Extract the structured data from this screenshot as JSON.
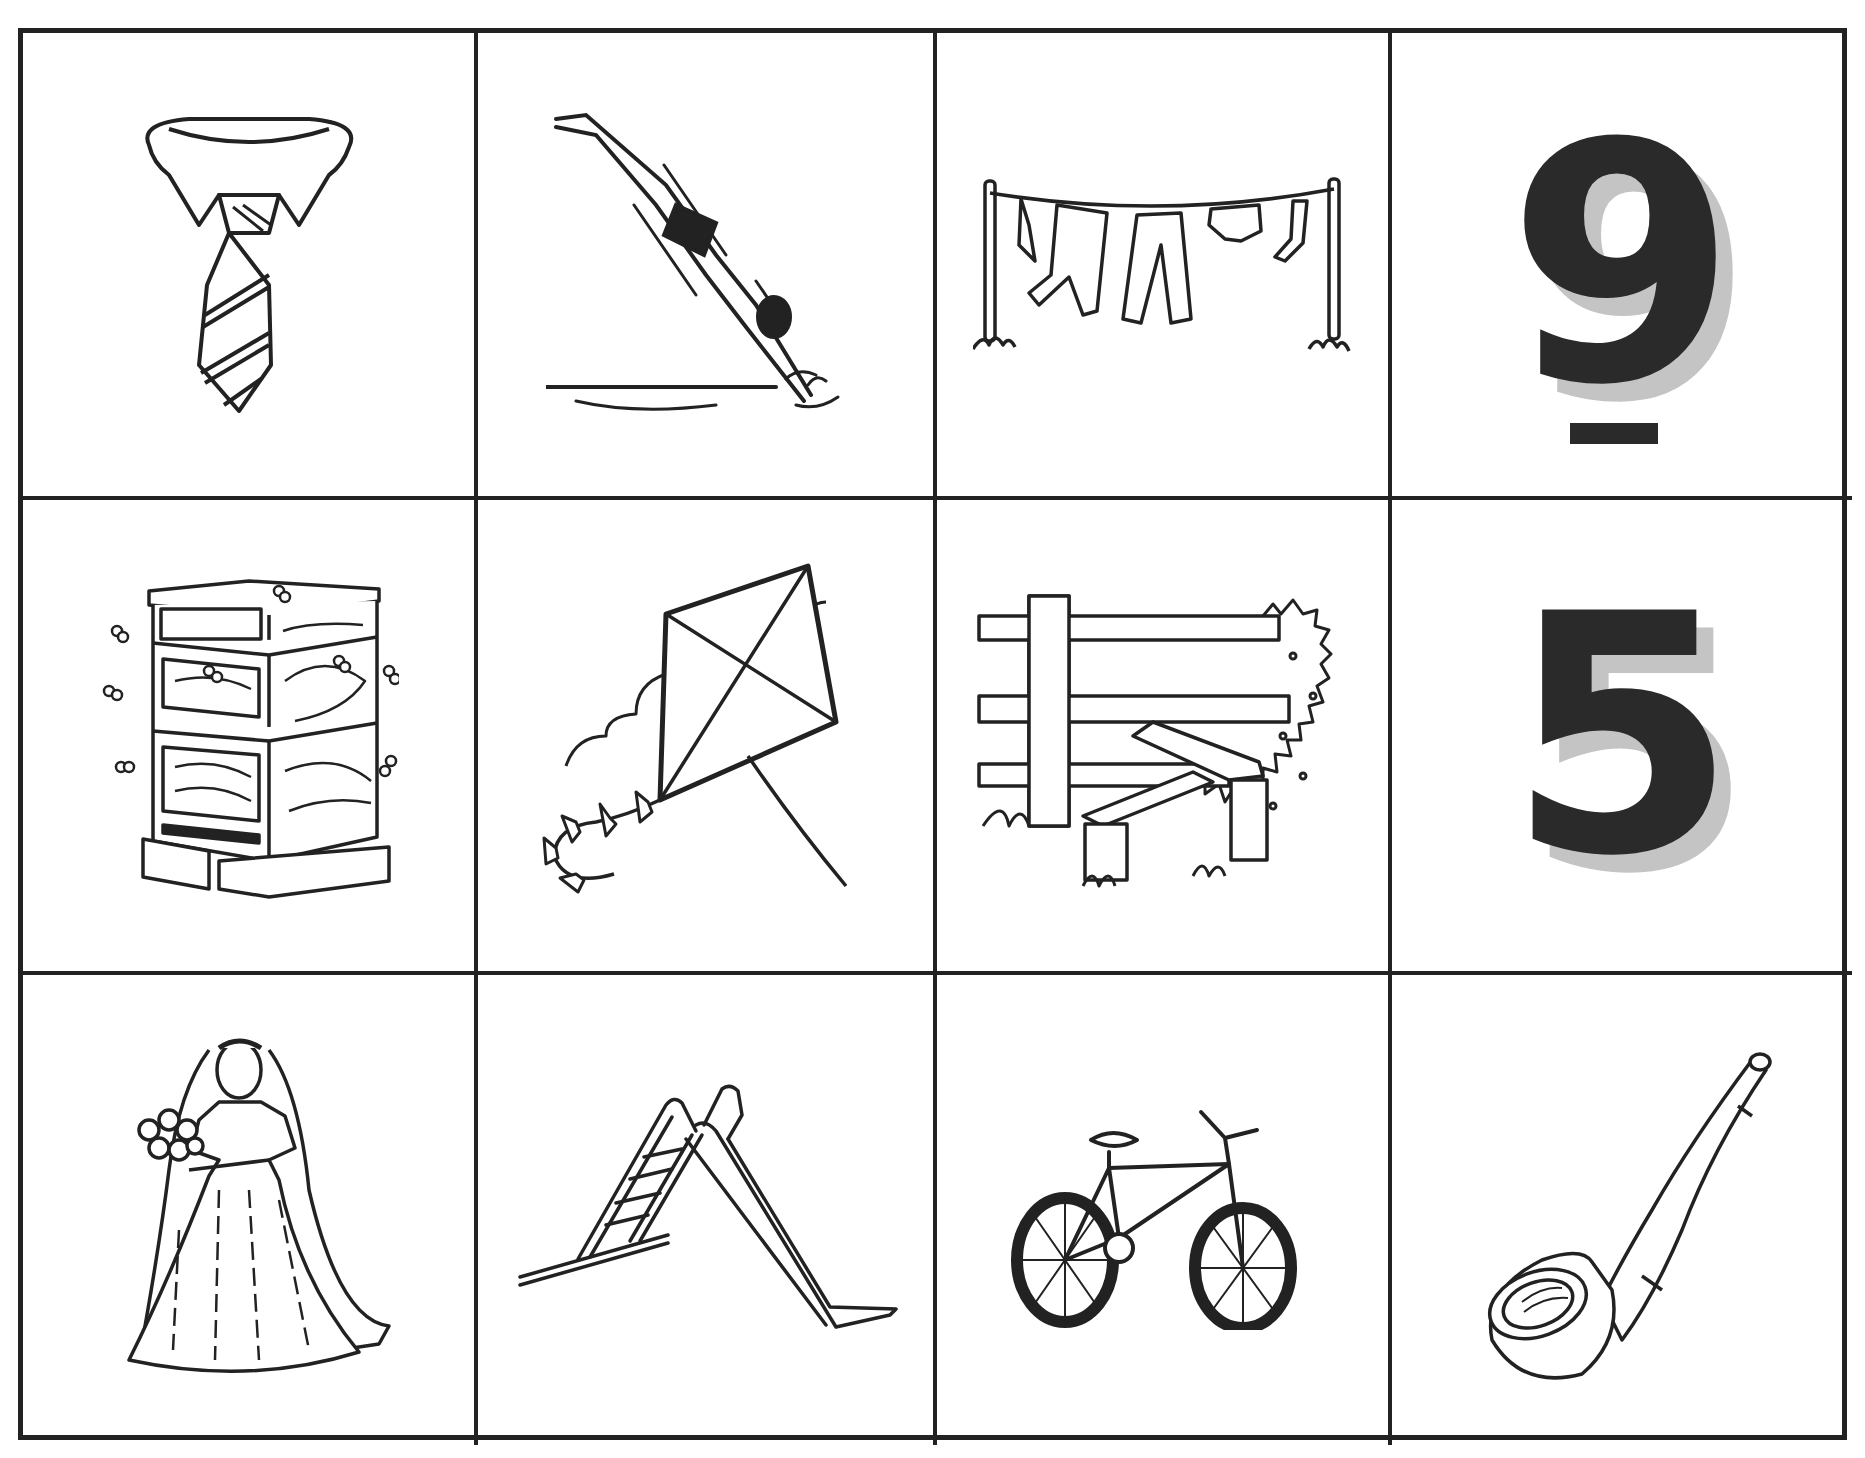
{
  "worksheet": {
    "colors": {
      "ink": "#2a2a2a",
      "numeral_shadow": "#c4c4c4",
      "grid_line": "#222222",
      "background": "#ffffff"
    },
    "rows": 3,
    "cols": 4,
    "cells": [
      {
        "row": 1,
        "col": 1,
        "type": "picture",
        "subject": "necktie with shirt collar",
        "icon": "necktie-icon"
      },
      {
        "row": 1,
        "col": 2,
        "type": "picture",
        "subject": "diver diving into water",
        "icon": "diver-icon"
      },
      {
        "row": 1,
        "col": 3,
        "type": "picture",
        "subject": "washing line with clothes",
        "icon": "clothesline-icon"
      },
      {
        "row": 1,
        "col": 4,
        "type": "numeral",
        "value": "9",
        "underlined": true
      },
      {
        "row": 2,
        "col": 1,
        "type": "picture",
        "subject": "beehive with bees",
        "icon": "beehive-icon"
      },
      {
        "row": 2,
        "col": 2,
        "type": "picture",
        "subject": "kite with tail and clouds",
        "icon": "kite-icon"
      },
      {
        "row": 2,
        "col": 3,
        "type": "picture",
        "subject": "wooden fence stile with bush",
        "icon": "stile-icon"
      },
      {
        "row": 2,
        "col": 4,
        "type": "numeral",
        "value": "5",
        "underlined": false
      },
      {
        "row": 3,
        "col": 1,
        "type": "picture",
        "subject": "bride with bouquet and veil",
        "icon": "bride-icon"
      },
      {
        "row": 3,
        "col": 2,
        "type": "picture",
        "subject": "playground slide",
        "icon": "slide-icon"
      },
      {
        "row": 3,
        "col": 3,
        "type": "picture",
        "subject": "bicycle",
        "icon": "bicycle-icon"
      },
      {
        "row": 3,
        "col": 4,
        "type": "picture",
        "subject": "smoking pipe",
        "icon": "pipe-icon"
      }
    ]
  }
}
